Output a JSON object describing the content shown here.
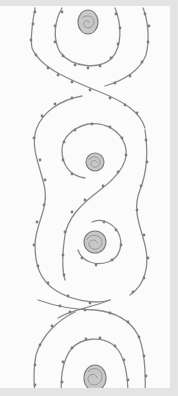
{
  "image": {
    "description": "Pencil sketch of a vertical quilting/embroidery border: interlocking S-shaped spirals with small dots (beads/stitches) along the lines and shaded circles at spiral centers",
    "colors": {
      "frame": "#e4e4e4",
      "paper": "#fbfbfb",
      "pencil": "#8a8a8a",
      "shading": "#c8c8c8"
    },
    "motifs": [
      {
        "name": "spiral-top",
        "center": [
          88,
          22
        ]
      },
      {
        "name": "spiral-upper-middle",
        "center": [
          95,
          162
        ]
      },
      {
        "name": "spiral-lower-middle",
        "center": [
          95,
          240
        ]
      },
      {
        "name": "spiral-bottom",
        "center": [
          95,
          378
        ]
      }
    ]
  }
}
